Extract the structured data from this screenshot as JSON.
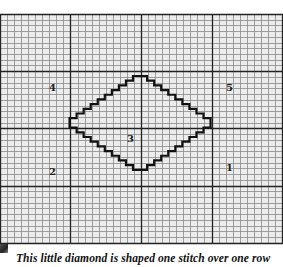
{
  "figure": {
    "grid": {
      "left": 0,
      "top": 14,
      "right": 283,
      "bottom": 243,
      "cell_w": 7.05,
      "cell_h": 5.72,
      "major_every": 10,
      "minor_color": "#8a8a8a",
      "major_color": "#222222",
      "background": "#ececec"
    },
    "diamond": {
      "steps_per_edge": 9,
      "top_x": 133,
      "top_y": 76,
      "stroke": "#111111"
    },
    "labels": [
      {
        "text": "4",
        "x": 49,
        "y": 83
      },
      {
        "text": "5",
        "x": 226,
        "y": 83
      },
      {
        "text": "3",
        "x": 127,
        "y": 134
      },
      {
        "text": "2",
        "x": 49,
        "y": 167
      },
      {
        "text": "1",
        "x": 226,
        "y": 163
      }
    ],
    "caption": "This little diamond is shaped one stitch over one row"
  }
}
